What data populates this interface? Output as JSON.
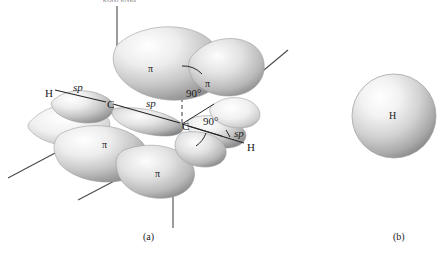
{
  "figure": {
    "top_label": "nodal plane",
    "panel_a": {
      "caption": "(a)",
      "atoms": [
        {
          "symbol": "H",
          "x": 45,
          "y": 88
        },
        {
          "symbol": "C",
          "x": 107,
          "y": 99
        },
        {
          "symbol": "C",
          "x": 182,
          "y": 121
        },
        {
          "symbol": "H",
          "x": 247,
          "y": 142
        }
      ],
      "hybrid_labels": [
        {
          "text": "sp",
          "x": 73,
          "y": 82
        },
        {
          "text": "sp",
          "x": 146,
          "y": 98
        },
        {
          "text": "sp",
          "x": 234,
          "y": 128
        }
      ],
      "pi_labels": [
        {
          "text": "π",
          "x": 148,
          "y": 64
        },
        {
          "text": "π",
          "x": 205,
          "y": 79
        },
        {
          "text": "π",
          "x": 102,
          "y": 140
        },
        {
          "text": "π",
          "x": 155,
          "y": 169
        }
      ],
      "angle_labels": [
        {
          "text": "90°",
          "x": 186,
          "y": 88
        },
        {
          "text": "90°",
          "x": 203,
          "y": 116
        }
      ]
    },
    "panel_b": {
      "caption": "(b)",
      "sphere_label": "H",
      "sphere": {
        "cx": 394,
        "cy": 116,
        "r": 42
      }
    }
  },
  "colors": {
    "lobe_light": "#fefefe",
    "lobe_mid": "#c9c9c9",
    "lobe_dark": "#8f8f8f",
    "line": "#3a3a3a",
    "text": "#1b1b1b",
    "background": "#ffffff"
  }
}
